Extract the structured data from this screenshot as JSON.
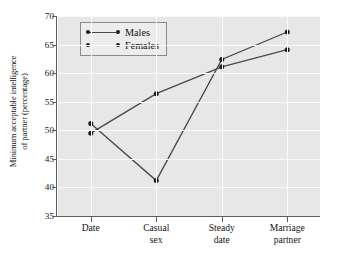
{
  "chart_data": {
    "type": "line",
    "title": "",
    "xlabel": "",
    "ylabel_lines": [
      "Minimum acceptable intelligence",
      "of partner (percentage)"
    ],
    "ylabel": "Minimum acceptable intelligence of partner (percentage)",
    "categories": [
      "Date",
      "Casual sex",
      "Steady date",
      "Marriage partner"
    ],
    "category_lines": [
      [
        "Date"
      ],
      [
        "Casual",
        "sex"
      ],
      [
        "Steady",
        "date"
      ],
      [
        "Marriage",
        "partner"
      ]
    ],
    "series": [
      {
        "name": "Males",
        "values": [
          49.5,
          56.4,
          61.1,
          64.1
        ]
      },
      {
        "name": "Females",
        "values": [
          51.2,
          41.2,
          62.4,
          67.2
        ]
      }
    ],
    "ylim": [
      35,
      70
    ],
    "yticks": [
      35,
      40,
      45,
      50,
      55,
      60,
      65,
      70
    ],
    "ytick_labels": [
      "35",
      "40",
      "45",
      "50",
      "55",
      "60",
      "65",
      "70"
    ],
    "grid": true,
    "grid_color": "#fbfbfb",
    "plot_background": "#e7e7e7",
    "legend": {
      "position": "upper-left-inside",
      "entries": [
        "Males",
        "Females"
      ]
    },
    "line_color": "#4a4a4a",
    "marker_color": "#1c1c1c"
  }
}
